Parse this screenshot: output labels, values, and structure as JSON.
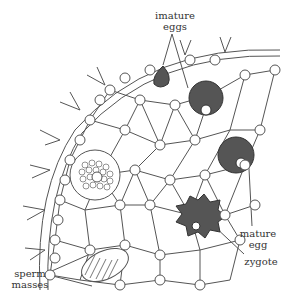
{
  "diagram": {
    "labels": {
      "immature_eggs": [
        "imature",
        "eggs"
      ],
      "mature_egg": [
        "mature",
        "egg"
      ],
      "zygote": "zygote",
      "sperm_masses": [
        "sperm",
        "masses"
      ]
    },
    "colors": {
      "stroke": "#444444",
      "egg_fill": "#555555",
      "cell_fill": "#ffffff",
      "text": "#333333"
    }
  }
}
